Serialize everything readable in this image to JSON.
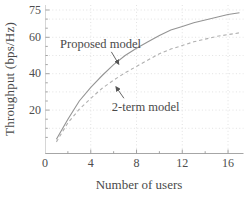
{
  "figure": {
    "kind": "scientific line plot",
    "background": "#ffffff"
  },
  "chart_data": {
    "type": "line",
    "title": "",
    "xlabel": "Number of users",
    "ylabel": "Throughput (bps/Hz)",
    "xlim": [
      0,
      17.3
    ],
    "ylim": [
      -4,
      78
    ],
    "x_ticks_labeled": [
      0,
      4,
      8,
      12,
      16
    ],
    "x_ticks_minor": [
      2,
      6,
      10,
      14
    ],
    "y_ticks_labeled": [
      20,
      40,
      60,
      75
    ],
    "y_ticks_minor": [
      5,
      10,
      15,
      25,
      30,
      35,
      45,
      50,
      55,
      65,
      70
    ],
    "gridlines": {
      "horizontal": [
        10,
        20,
        30,
        40,
        50,
        60,
        70,
        75
      ],
      "vertical": [
        4,
        8,
        12,
        16
      ],
      "style": "dotted"
    },
    "legend_position": "none (inline annotations with arrows)",
    "x": [
      1,
      2,
      3,
      4,
      5,
      6,
      7,
      8,
      9,
      10,
      11,
      12,
      13,
      14,
      15,
      16,
      17
    ],
    "series": [
      {
        "name": "Proposed model",
        "line_style": "solid",
        "color": "#949494",
        "values": [
          4,
          15,
          25,
          32.5,
          39,
          45,
          50,
          54,
          57.5,
          61,
          64,
          66,
          68,
          69.5,
          71,
          72.5,
          73.5
        ]
      },
      {
        "name": "2-term model",
        "line_style": "dashed",
        "color": "#b0b0b0",
        "values": [
          2.5,
          13,
          20.5,
          26.5,
          32,
          36.5,
          40.5,
          44,
          47.5,
          51,
          53.5,
          55.5,
          57.5,
          59,
          60.5,
          61.5,
          62.5
        ]
      }
    ],
    "annotations": [
      {
        "text": "Proposed model",
        "text_center": [
          4.85,
          56.3
        ],
        "arrow_from": [
          5.8,
          52
        ],
        "arrow_to": [
          6.45,
          45.2
        ]
      },
      {
        "text": "2-term model",
        "text_center": [
          8.8,
          21.7
        ],
        "arrow_from": [
          6.9,
          26.5
        ],
        "arrow_to": [
          6.2,
          32.8
        ]
      }
    ],
    "colors": {
      "axis": "#a6a6a6",
      "ticks": "#9a9a9a",
      "grid": "#dadada",
      "text": "#4a4a4a",
      "arrow": "#555555"
    }
  }
}
